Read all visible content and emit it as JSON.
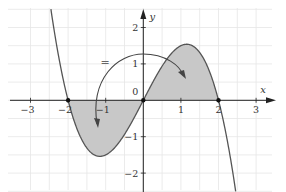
{
  "chart_data": {
    "type": "line",
    "title": "",
    "function": "f(x) = 0.5·x·(4 − x²)",
    "xlabel": "x",
    "ylabel": "y",
    "origin_label": "0",
    "xlim": [
      -3.3,
      3.3
    ],
    "ylim": [
      -2.5,
      2.5
    ],
    "x_ticks": [
      -3,
      -2,
      -1,
      1,
      2,
      3
    ],
    "x_tick_labels": [
      "−3",
      "−2",
      "−1",
      "1",
      "2",
      "3"
    ],
    "y_ticks": [
      -2,
      -1,
      1,
      2
    ],
    "y_tick_labels": [
      "−2",
      "−1",
      "1",
      "2"
    ],
    "grid": true,
    "grid_step": 0.5,
    "zeros": [
      -2,
      0,
      2
    ],
    "local_min": {
      "x": -1.15,
      "y": -1.54
    },
    "local_max": {
      "x": 1.15,
      "y": 1.54
    },
    "shaded_regions": [
      {
        "from": -2,
        "to": 0,
        "side": "below x-axis"
      },
      {
        "from": 0,
        "to": 2,
        "side": "above x-axis"
      }
    ],
    "annotation": {
      "symbol": "=",
      "description": "curved double-headed arrow connecting the two shaded regions, indicating equal areas"
    },
    "curve_color": "#555555",
    "fill_color": "#c8c8c8",
    "grid_color": "#e6e6e6",
    "axis_color": "#222222"
  }
}
